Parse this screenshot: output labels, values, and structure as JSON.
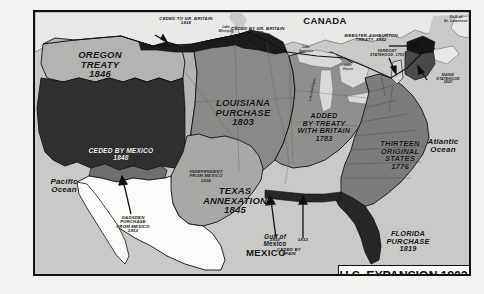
{
  "title": {
    "text": "U.S. EXPANSION 1803-1853"
  },
  "colors": {
    "ocean": "#c9c9c7",
    "canada": "#e9e9e7",
    "mexico": "#fbfbfa",
    "oregon_treaty": "#b3b3b1",
    "ceded_by_mexico": "#2f2f2f",
    "louisiana_purchase": "#898987",
    "texas_annexation": "#a8a8a6",
    "added_by_treaty_1783": "#8f8f8d",
    "thirteen_states": "#7c7c7a",
    "florida_purchase": "#262626",
    "ceded_to_gr_britain": "#1c1c1c",
    "gadsden_purchase": "#6f6f6d",
    "border": "#111111",
    "frame": "#111111",
    "label_text": "#111111"
  },
  "regions": [
    {
      "id": "oregon-treaty",
      "label": "OREGON\nTREATY\n1846"
    },
    {
      "id": "ceded-by-mexico",
      "label": "CEDED BY MEXICO\n1848"
    },
    {
      "id": "louisiana-purchase",
      "label": "LOUISIANA\nPURCHASE\n1803"
    },
    {
      "id": "texas-annexation",
      "label": "TEXAS\nANNEXATION\n1845"
    },
    {
      "id": "added-by-treaty",
      "label": "ADDED\nBY TREATY\nWITH BRITAIN\n1783"
    },
    {
      "id": "thirteen-states",
      "label": "THIRTEEN\nORIGINAL\nSTATES\n1776"
    },
    {
      "id": "florida-purchase",
      "label": "FLORIDA\nPURCHASE\n1819"
    }
  ],
  "annotations": [
    {
      "id": "ceded-to-gr-britain",
      "label": "CEDED TO GR. BRITAIN\n1818"
    },
    {
      "id": "ceded-by-gr-britain",
      "label": "CEDED BY GR. BRITAIN\n1818"
    },
    {
      "id": "webster-ashburton",
      "label": "WEBSTER-ASHBURTON\nTREATY, 1842"
    },
    {
      "id": "vermont-statehood",
      "label": "VERMONT\nSTATEHOOD, 1791"
    },
    {
      "id": "maine-statehood",
      "label": "MAINE\nSTATEHOOD\n1820"
    },
    {
      "id": "independent-mexico",
      "label": "INDEPENDENT\nFROM MEXICO\n1836"
    },
    {
      "id": "gadsden-purchase",
      "label": "GADSDEN\nPURCHASE\nFROM MEXICO\n1853"
    },
    {
      "id": "ceded-by-spain",
      "label": "CEDED BY\nSPAIN"
    },
    {
      "id": "spain-date-1810",
      "label": "1810"
    },
    {
      "id": "spain-date-1813",
      "label": "1813"
    }
  ],
  "countries": [
    {
      "id": "canada",
      "label": "CANADA"
    },
    {
      "id": "mexico",
      "label": "MEXICO"
    }
  ],
  "waters": [
    {
      "id": "pacific-ocean",
      "label": "Pacific\nOcean"
    },
    {
      "id": "atlantic-ocean",
      "label": "Atlantic\nOcean"
    },
    {
      "id": "gulf-of-mexico",
      "label": "Gulf  of\nMexico"
    },
    {
      "id": "gulf-of-st-lawrence",
      "label": "Gulf of\nSt. Lawrence"
    }
  ],
  "lakes": [
    {
      "id": "lake-winnipeg",
      "label": "Lake\nWinnipeg"
    },
    {
      "id": "lake-superior",
      "label": "Lake\nSuperior"
    },
    {
      "id": "lake-huron",
      "label": "Lake\nHuron"
    },
    {
      "id": "lake-michigan",
      "label": "Lake Michigan"
    }
  ]
}
